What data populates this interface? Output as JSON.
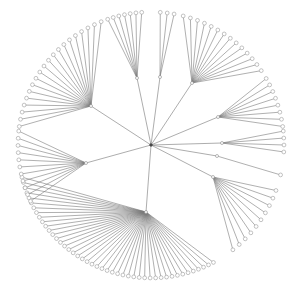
{
  "diagram": {
    "type": "radial-tree",
    "colors": {
      "edge": "#7a7a7a",
      "node_stroke": "#9a9a9a",
      "node_fill": "#ffffff",
      "background": "#ffffff"
    },
    "root": {
      "x": 151,
      "y": 145
    },
    "leaf_radius": 133,
    "clusters": [
      {
        "name": "upper-left",
        "hub": {
          "x": 91,
          "y": 106
        },
        "leaf_count": 20,
        "angle_start": 172,
        "angle_end": 112
      },
      {
        "name": "top-left",
        "hub": {
          "x": 137,
          "y": 78
        },
        "leaf_count": 7,
        "angle_start": 109,
        "angle_end": 94
      },
      {
        "name": "top",
        "hub": {
          "x": 160,
          "y": 77
        },
        "leaf_count": 3,
        "angle_start": 86,
        "angle_end": 80
      },
      {
        "name": "top-right",
        "hub": {
          "x": 192,
          "y": 83
        },
        "leaf_count": 14,
        "angle_start": 76,
        "angle_end": 34
      },
      {
        "name": "right-upper",
        "hub": {
          "x": 218,
          "y": 117
        },
        "leaf_count": 8,
        "angle_start": 30,
        "angle_end": 8
      },
      {
        "name": "right-middle",
        "hub": {
          "x": 222,
          "y": 143
        },
        "leaf_count": 4,
        "angle_start": 6,
        "angle_end": -3
      },
      {
        "name": "right-single",
        "hub": {
          "x": 217,
          "y": 156
        },
        "leaf_count": 1,
        "angle_start": -13,
        "angle_end": -13
      },
      {
        "name": "right-lower",
        "hub": {
          "x": 213,
          "y": 177
        },
        "leaf_count": 10,
        "angle_start": -20,
        "angle_end": -52
      },
      {
        "name": "bottom",
        "hub": {
          "x": 146,
          "y": 212
        },
        "leaf_count": 45,
        "angle_start": -62,
        "angle_end": -166
      },
      {
        "name": "left",
        "hub": {
          "x": 86,
          "y": 163
        },
        "leaf_count": 11,
        "angle_start": 174,
        "angle_end": 205
      }
    ]
  }
}
